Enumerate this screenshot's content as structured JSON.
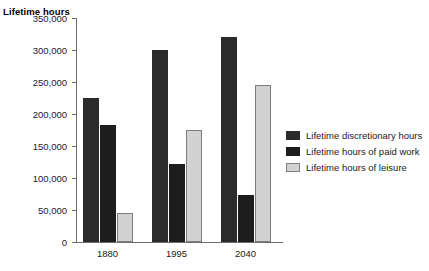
{
  "chart_data": {
    "type": "bar",
    "title": "",
    "subtitle": "",
    "xlabel": "",
    "ylabel": "Lifetime hours",
    "categories": [
      "1880",
      "1995",
      "2040"
    ],
    "series": [
      {
        "name": "Lifetime discretionary hours",
        "color": "#2b2b2b",
        "values": [
          225000,
          300000,
          320000
        ]
      },
      {
        "name": "Lifetime hours of paid work",
        "color": "#1d1d1d",
        "values": [
          183000,
          122000,
          73000
        ]
      },
      {
        "name": "Lifetime hours of leisure",
        "color": "#d2d2d2",
        "values": [
          45000,
          175000,
          245000
        ]
      }
    ],
    "ylim": [
      0,
      350000
    ],
    "ytick_labels": [
      "0",
      "50,000",
      "100,000",
      "150,000",
      "200,000",
      "250,000",
      "300,000",
      "350,000"
    ],
    "ytick_values": [
      0,
      50000,
      100000,
      150000,
      200000,
      250000,
      300000,
      350000
    ],
    "grid": false,
    "legend_position": "right"
  }
}
